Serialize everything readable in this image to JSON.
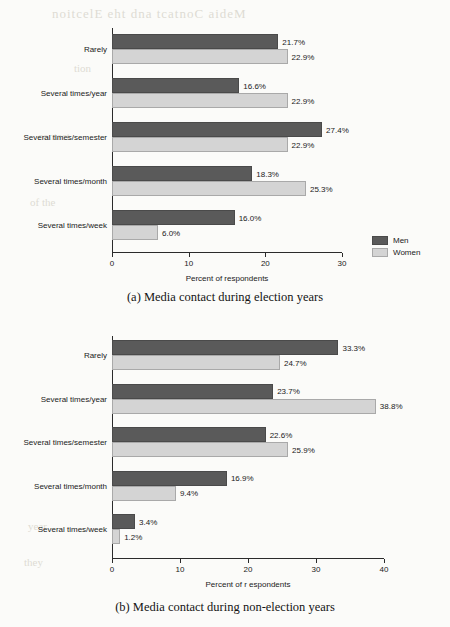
{
  "page": {
    "background_color": "#fbfbf9",
    "bleed_through": [
      "noitcelE eht dna tcatnoC aideM",
      "tion",
      "contact",
      "of the",
      "year",
      "they"
    ]
  },
  "colors": {
    "men": "#5a5a5a",
    "women": "#d4d4d4",
    "axis": "#2b2b2b",
    "text": "#1a1a1a"
  },
  "legend": {
    "position": "right",
    "entries": [
      {
        "label": "Men",
        "color": "#5a5a5a"
      },
      {
        "label": "Women",
        "color": "#d4d4d4"
      }
    ]
  },
  "figures": [
    {
      "id": "a",
      "caption": "(a) Media contact during election years"
    },
    {
      "id": "b",
      "caption": "(b) Media contact during non-election years"
    }
  ],
  "chart_data": [
    {
      "type": "bar",
      "orientation": "horizontal",
      "title": "(a) Media contact during election years",
      "xlabel": "Percent of respondents",
      "ylabel": "",
      "xlim": [
        0,
        30
      ],
      "xticks": [
        0,
        10,
        20,
        30
      ],
      "xtick_labels": [
        "0",
        "10",
        "20",
        "30"
      ],
      "grid": false,
      "legend_position": "right",
      "categories": [
        "Rarely",
        "Several times/year",
        "Several times/semester",
        "Several times/month",
        "Several times/week"
      ],
      "series": [
        {
          "name": "Men",
          "color": "#5a5a5a",
          "values": [
            21.7,
            16.6,
            27.4,
            18.3,
            16.0
          ],
          "labels": [
            "21.7%",
            "16.6%",
            "27.4%",
            "18.3%",
            "16.0%"
          ]
        },
        {
          "name": "Women",
          "color": "#d4d4d4",
          "values": [
            22.9,
            22.9,
            22.9,
            25.3,
            6.0
          ],
          "labels": [
            "22.9%",
            "22.9%",
            "22.9%",
            "25.3%",
            "6.0%"
          ]
        }
      ]
    },
    {
      "type": "bar",
      "orientation": "horizontal",
      "title": "(b) Media contact during non-election years",
      "xlabel": "Percent of r espondents",
      "ylabel": "",
      "xlim": [
        0,
        40
      ],
      "xticks": [
        0,
        10,
        20,
        30,
        40
      ],
      "xtick_labels": [
        "0",
        "10",
        "20",
        "30",
        "40"
      ],
      "grid": false,
      "legend_position": "right",
      "categories": [
        "Rarely",
        "Several times/year",
        "Several times/semester",
        "Several times/month",
        "Several times/week"
      ],
      "series": [
        {
          "name": "Men",
          "color": "#5a5a5a",
          "values": [
            33.3,
            23.7,
            22.6,
            16.9,
            3.4
          ],
          "labels": [
            "33.3%",
            "23.7%",
            "22.6%",
            "16.9%",
            "3.4%"
          ]
        },
        {
          "name": "Women",
          "color": "#d4d4d4",
          "values": [
            24.7,
            38.8,
            25.9,
            9.4,
            1.2
          ],
          "labels": [
            "24.7%",
            "38.8%",
            "25.9%",
            "9.4%",
            "1.2%"
          ]
        }
      ]
    }
  ]
}
